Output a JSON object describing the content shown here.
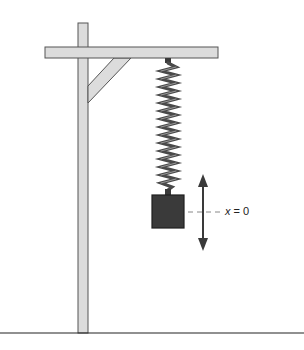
{
  "diagram": {
    "type": "mass-spring-system",
    "label": {
      "variable": "x",
      "equals": "=",
      "value": "0"
    },
    "colors": {
      "frame_fill": "#dcdcdc",
      "frame_stroke": "#555555",
      "spring": "#4a4a4a",
      "mass_fill": "#3a3a3a",
      "mass_stroke": "#1e1e1e",
      "arrow": "#3a3a3a",
      "dash": "#888888",
      "ground": "#222222"
    }
  }
}
